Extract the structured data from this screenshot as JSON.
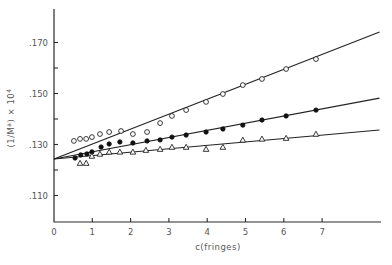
{
  "chart_data": {
    "type": "scatter",
    "title": "",
    "xlabel": "c(fringes)",
    "ylabel": "(1/M^a) × 10^4",
    "ylabel_main": "(1/M",
    "ylabel_sup": "a",
    "ylabel_tail": ") × 10",
    "ylabel_exp": "4",
    "xlim": [
      0,
      8.5
    ],
    "ylim": [
      0.1,
      0.183
    ],
    "grid": false,
    "legend": null,
    "x_ticks": [
      0,
      1,
      2,
      3,
      4,
      5,
      6,
      7
    ],
    "x_tick_labels": [
      "0",
      "1",
      "2",
      "3",
      "4",
      "5",
      "6",
      "7"
    ],
    "y_major_ticks": [
      0.11,
      0.13,
      0.15,
      0.17
    ],
    "y_major_tick_labels": [
      ".110",
      ".130",
      ".150",
      ".170"
    ],
    "y_minor_ticks": [
      0.12,
      0.14,
      0.16
    ],
    "series": [
      {
        "name": "open circles",
        "marker": "open-circle",
        "fit": {
          "intercept": 0.1243,
          "end_x": 8.5,
          "end_y": 0.1741
        },
        "x": [
          0.52,
          0.68,
          0.84,
          0.99,
          1.2,
          1.44,
          1.75,
          2.06,
          2.43,
          2.77,
          3.08,
          3.45,
          3.97,
          4.41,
          4.93,
          5.43,
          6.06,
          6.84
        ],
        "y": [
          0.1314,
          0.1322,
          0.1322,
          0.1329,
          0.1341,
          0.1349,
          0.1353,
          0.1341,
          0.1349,
          0.1384,
          0.1412,
          0.1435,
          0.1467,
          0.1498,
          0.1533,
          0.1557,
          0.1596,
          0.1635
        ]
      },
      {
        "name": "filled circles",
        "marker": "filled-circle",
        "fit": {
          "intercept": 0.1243,
          "end_x": 8.5,
          "end_y": 0.1482
        },
        "x": [
          0.55,
          0.7,
          0.86,
          0.99,
          1.23,
          1.44,
          1.72,
          2.06,
          2.43,
          2.77,
          3.08,
          3.45,
          3.97,
          4.41,
          4.93,
          5.43,
          6.06,
          6.84
        ],
        "y": [
          0.1247,
          0.1259,
          0.1263,
          0.1271,
          0.129,
          0.1302,
          0.131,
          0.1306,
          0.1314,
          0.1318,
          0.1329,
          0.1337,
          0.1349,
          0.1361,
          0.1376,
          0.1396,
          0.1412,
          0.1435
        ]
      },
      {
        "name": "open triangles",
        "marker": "open-triangle",
        "fit": {
          "intercept": 0.1243,
          "end_x": 8.5,
          "end_y": 0.1357
        },
        "x": [
          0.68,
          0.84,
          0.99,
          1.2,
          1.44,
          1.72,
          2.06,
          2.4,
          2.77,
          3.08,
          3.45,
          3.97,
          4.41,
          4.93,
          5.43,
          6.06,
          6.84
        ],
        "y": [
          0.1227,
          0.1227,
          0.1255,
          0.1263,
          0.1271,
          0.1271,
          0.1271,
          0.1278,
          0.1282,
          0.129,
          0.129,
          0.1282,
          0.129,
          0.1318,
          0.1322,
          0.1325,
          0.1341
        ]
      }
    ]
  },
  "layout": {
    "x0_px": 54,
    "px_per_x": 38.3,
    "y0_px": 221,
    "y0_val": 0.1,
    "px_per_y": 2550,
    "axis_top_px": 9,
    "axis_right_px": 381
  }
}
